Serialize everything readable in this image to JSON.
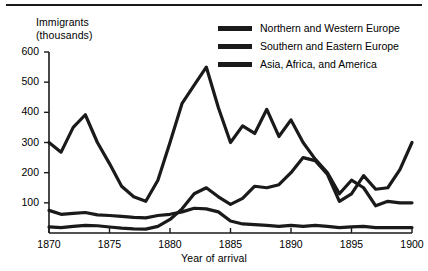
{
  "chart_data": {
    "type": "line",
    "title": "",
    "xlabel": "Year of arrival",
    "ylabel": "Immigrants (thousands)",
    "ylabel_lines": [
      "Immigrants",
      "(thousands)"
    ],
    "xlim": [
      1870,
      1900
    ],
    "ylim": [
      0,
      600
    ],
    "grid": false,
    "legend_position": "top-right",
    "yticks": [
      0,
      100,
      200,
      300,
      400,
      500,
      600
    ],
    "ytick_labels": [
      "",
      "100",
      "200",
      "300",
      "400",
      "500",
      "600"
    ],
    "xticks": [
      1870,
      1875,
      1880,
      1885,
      1890,
      1895,
      1900
    ],
    "xtick_labels": [
      "1870",
      "1875",
      "1880",
      "1885",
      "1890",
      "1895",
      "1900"
    ],
    "x": [
      1870,
      1871,
      1872,
      1873,
      1874,
      1875,
      1876,
      1877,
      1878,
      1879,
      1880,
      1881,
      1882,
      1883,
      1884,
      1885,
      1886,
      1887,
      1888,
      1889,
      1890,
      1891,
      1892,
      1893,
      1894,
      1895,
      1896,
      1897,
      1898,
      1899,
      1900
    ],
    "series": [
      {
        "name": "Northern and Western Europe",
        "color": "#1a1a1a",
        "values": [
          300,
          268,
          350,
          392,
          300,
          230,
          155,
          120,
          105,
          175,
          300,
          430,
          490,
          550,
          415,
          300,
          355,
          330,
          410,
          320,
          375,
          300,
          245,
          200,
          130,
          175,
          150,
          90,
          105,
          100,
          100
        ]
      },
      {
        "name": "Southern and Eastern Europe",
        "color": "#1a1a1a",
        "values": [
          20,
          18,
          22,
          25,
          24,
          20,
          16,
          14,
          13,
          22,
          45,
          80,
          130,
          150,
          120,
          95,
          115,
          155,
          150,
          160,
          200,
          250,
          240,
          195,
          105,
          130,
          190,
          145,
          150,
          210,
          300
        ]
      },
      {
        "name": "Asia, Africa, and America",
        "color": "#1a1a1a",
        "values": [
          75,
          62,
          65,
          68,
          60,
          58,
          55,
          52,
          50,
          58,
          62,
          70,
          82,
          80,
          70,
          40,
          30,
          28,
          25,
          22,
          25,
          22,
          25,
          22,
          18,
          20,
          22,
          18,
          18,
          18,
          18
        ]
      }
    ]
  },
  "legend": {
    "items": [
      {
        "label": "Northern and Western Europe"
      },
      {
        "label": "Southern and Eastern Europe"
      },
      {
        "label": "Asia, Africa, and America"
      }
    ]
  }
}
